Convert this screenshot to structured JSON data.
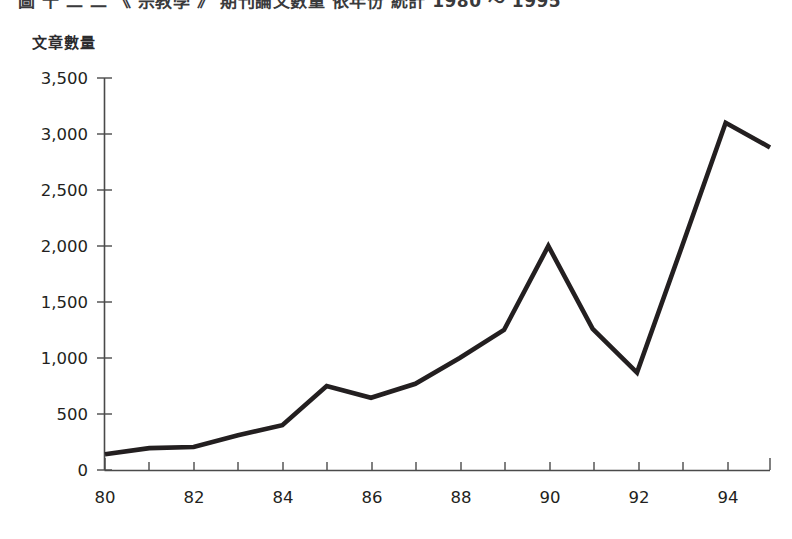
{
  "figure": {
    "clipped_top_caption": "圖 十 二   二   《 宗教學 》 期刊論文數量   依年份 統計 1980 ～ 1995",
    "y_axis_caption": "文章數量"
  },
  "chart_data": {
    "type": "line",
    "title": "",
    "xlabel": "",
    "ylabel": "文章數量",
    "x": [
      80,
      81,
      82,
      83,
      84,
      85,
      86,
      87,
      88,
      89,
      90,
      91,
      92,
      93,
      94,
      95
    ],
    "values": [
      140,
      195,
      205,
      310,
      400,
      750,
      645,
      770,
      1000,
      1250,
      2000,
      1260,
      870,
      1980,
      3100,
      2880
    ],
    "series": [
      {
        "name": "文章數量",
        "values": [
          140,
          195,
          205,
          310,
          400,
          750,
          645,
          770,
          1000,
          1250,
          2000,
          1260,
          870,
          1980,
          3100,
          2880
        ]
      }
    ],
    "xlim": [
      80,
      95
    ],
    "ylim": [
      0,
      3500
    ],
    "ytick_values": [
      0,
      500,
      1000,
      1500,
      2000,
      2500,
      3000,
      3500
    ],
    "ytick_labels": [
      "0",
      "500",
      "1,000",
      "1,500",
      "2,000",
      "2,500",
      "3,000",
      "3,500"
    ],
    "xtick_values": [
      80,
      81,
      82,
      83,
      84,
      85,
      86,
      87,
      88,
      89,
      90,
      91,
      92,
      93,
      94,
      95
    ],
    "xtick_labels_shown": [
      "80",
      "",
      "82",
      "",
      "84",
      "",
      "86",
      "",
      "88",
      "",
      "90",
      "",
      "92",
      "",
      "94",
      ""
    ],
    "xtick_label_interval": 2,
    "grid": false,
    "legend": false,
    "legend_position": "none",
    "line_color": "#231f20",
    "axis_color": "#4a4a4a",
    "background_color": "#ffffff",
    "annotations": []
  }
}
